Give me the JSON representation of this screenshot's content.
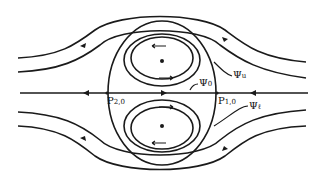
{
  "diagram": {
    "type": "streamline flow around vortex pair (Hill-type)",
    "labels": {
      "psi_u": {
        "symbol": "Ψ",
        "sub": "u"
      },
      "psi_0": {
        "symbol": "Ψ",
        "sub": "0"
      },
      "psi_l": {
        "symbol": "Ψ",
        "sub": "ℓ"
      },
      "p10": {
        "symbol": "P",
        "sub": "1,0"
      },
      "p20": {
        "symbol": "P",
        "sub": "2,0"
      }
    },
    "colors": {
      "line": "#1a1a1a",
      "background": "#ffffff"
    }
  }
}
